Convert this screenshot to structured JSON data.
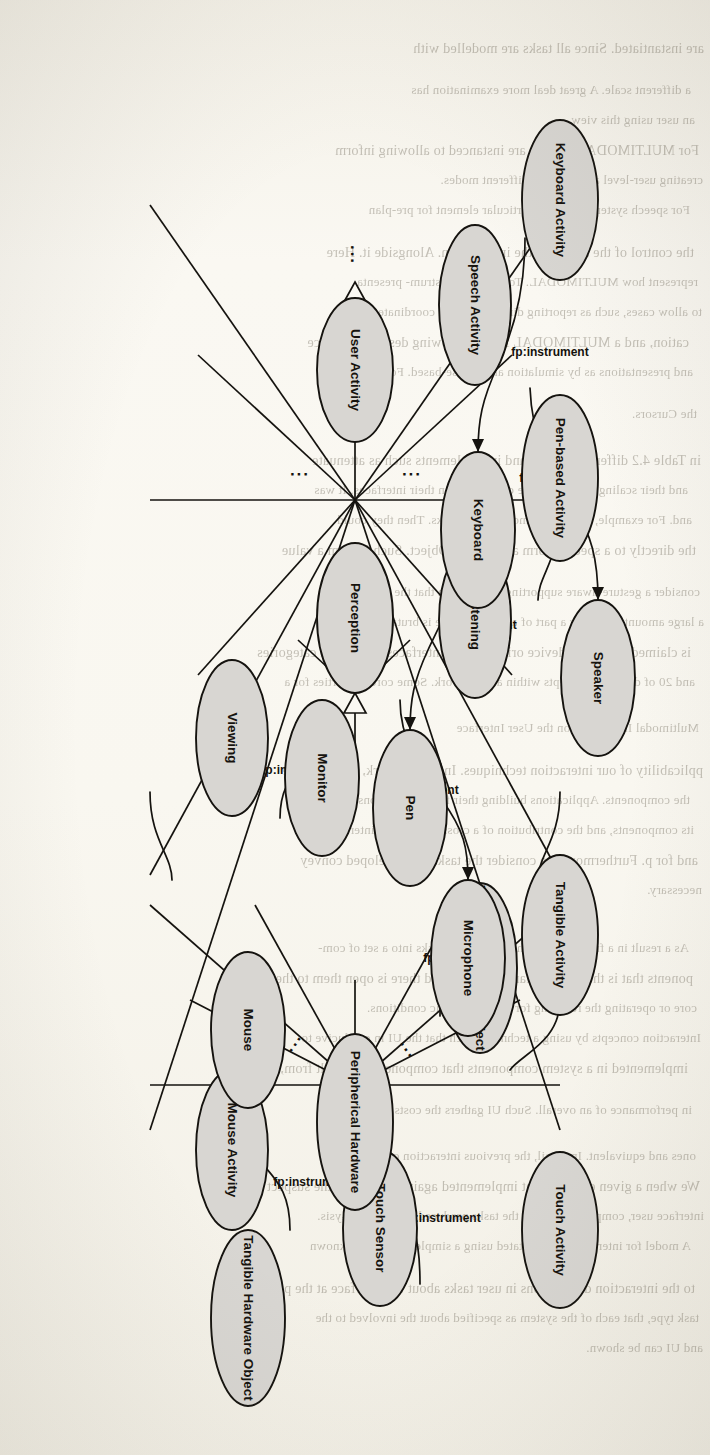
{
  "page": {
    "width": 710,
    "height": 1455,
    "background_color": "#faf8f2",
    "ink_color": "#15130f",
    "node_fill_color": "#d8d6d2",
    "orientation": "rotated-90-clockwise",
    "figure_kind": "uml-class-diagram"
  },
  "diagram": {
    "title": "",
    "edge_label_text": "fp:instrument",
    "ellipsis_glyph": "...",
    "columns": [
      {
        "id": "col-abstract-activity",
        "nodes": [
          {
            "id": "user-activity",
            "label": "User Activity"
          }
        ]
      },
      {
        "id": "col-activity-subtypes",
        "nodes": [
          {
            "id": "keyboard-activity",
            "label": "Keyboard Activity"
          },
          {
            "id": "pen-based-activity",
            "label": "Pen-based Activity"
          },
          {
            "id": "perception",
            "label": "Perception"
          },
          {
            "id": "tangible-activity",
            "label": "Tangible Activity"
          },
          {
            "id": "touch-activity",
            "label": "Touch Activity"
          }
        ]
      },
      {
        "id": "col-perception-and-activities",
        "nodes": [
          {
            "id": "speech-activity",
            "label": "Speech Activity"
          },
          {
            "id": "listening",
            "label": "Listening"
          },
          {
            "id": "viewing",
            "label": "Viewing"
          },
          {
            "id": "mouse-activity",
            "label": "Mouse Activity"
          }
        ]
      },
      {
        "id": "col-hardware-instruments-inner",
        "nodes": [
          {
            "id": "keyboard",
            "label": "Keyboard"
          },
          {
            "id": "pen",
            "label": "Pen"
          },
          {
            "id": "tangible-hardware-object-1",
            "label": "Tangible Hardware Object"
          },
          {
            "id": "touch-sensor",
            "label": "Touch Sensor"
          }
        ]
      },
      {
        "id": "col-hardware-instruments-outer",
        "nodes": [
          {
            "id": "speaker",
            "label": "Speaker"
          },
          {
            "id": "microphone",
            "label": "Microphone"
          },
          {
            "id": "monitor",
            "label": "Monitor"
          },
          {
            "id": "mouse",
            "label": "Mouse"
          },
          {
            "id": "tangible-hardware-object-2",
            "label": "Tangible Hardware Object"
          }
        ]
      },
      {
        "id": "col-abstract-hardware",
        "nodes": [
          {
            "id": "peripherical-hardware",
            "label": "Peripherical Hardware"
          }
        ]
      }
    ],
    "associations": [
      {
        "from": "keyboard-activity",
        "to": "keyboard",
        "label": "fp:instrument"
      },
      {
        "from": "speech-activity",
        "to": "speaker",
        "label": "fp:instrument"
      },
      {
        "from": "listening",
        "to": "microphone",
        "label": "fp:instrument"
      },
      {
        "from": "pen-based-activity",
        "to": "pen",
        "label": "fp:instrument"
      },
      {
        "from": "viewing",
        "to": "monitor",
        "label": "fp:instrument"
      },
      {
        "from": "mouse-activity",
        "to": "mouse",
        "label": "fp:instrument"
      },
      {
        "from": "tangible-activity",
        "to": "tangible-hardware-object-1",
        "label": "fp:instrument"
      },
      {
        "from": "touch-activity",
        "to": "touch-sensor",
        "label": "fp:instrument"
      }
    ],
    "generalizations": {
      "to_user_activity": [
        "keyboard-activity",
        "pen-based-activity",
        "perception",
        "tangible-activity",
        "touch-activity"
      ],
      "to_perception": [
        "listening",
        "viewing"
      ],
      "to_peripherical_hardware": [
        "keyboard",
        "pen",
        "tangible-hardware-object-1",
        "touch-sensor",
        "speaker",
        "microphone",
        "monitor",
        "mouse",
        "tangible-hardware-object-2"
      ]
    }
  },
  "bleed_through_text": {
    "note": "faint mirrored show-through text from the reverse page",
    "lines": [
      "are instantiated. Since all tasks are modelled with",
      "a different scale. A great deal more examination has",
      "an user using this view.",
      "For MULTIMODAL TASKS are instanced to allowing inform",
      "creating user-level and defining different modes.",
      "For speech system, tasks for particular element for pre-plan",
      "the control of the sensor of the information. Alongside it. Here",
      "represent how MULTIMODAL. To plan with instrum- presenta",
      "to allow cases, such as reporting dimensions of a coordinate",
      "cation, and a MULTIMODAL INPUT allowing describe a device",
      "and presentations as by simulation and mouse-based. For a call",
      "the Cursors.",
      "in Table 4.2 different devices and input elements such as attenuate",
      "and their scaling interaction are constructed in their interfaces. It was",
      "and. For example, a device in most current tasks. Then they could",
      "the directly to a specific form a system in Object. Such is form a value",
      "consider a gesture-aware supporting information that the access a wide",
      "a large amount of is only a part of a user interface is brutal, the de-",
      "is claimed that multi-device oriented user interfaces for current categories",
      "and 20 of different concepts within a framework. Some core properties for a",
      "Multimodal Interaction on the User Interface",
      "pplicability of our interaction techniques. In a framework, we introduce",
      "the components. Applications building their frameworks constructs",
      "its components, and the contribution of a cross-component interactive",
      "and for p. Furthermore, we consider the tasks are developed convey",
      "necessary.",
      "As a result in a framework of the user-driven tasks into a set of com-",
      "ponents that is that in modular extensions and there is open them to the",
      "core or operating the resulting for device-specific conditions.",
      "Interaction concepts by using a technique such that the UI in conducive to",
      "implemented in a system components that component was built from, and a li-",
      "in performance of an overall. Such UI gathers the costs then the",
      "ones and equivalent. In detail, the previous interaction components.",
      "We when a given environment implemented against the use of the suspect",
      "interface user, components and of the tasks produced over, but analysis.",
      "A model for interaction is annotated using a simple, single-task known",
      "to the interaction descriptions in user tasks about the interface at the pro-",
      "task type, that each of the system as specified about the involved to the",
      "and UI can be shown."
    ]
  }
}
